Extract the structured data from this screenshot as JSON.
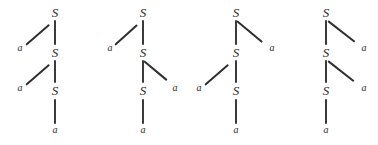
{
  "figure": {
    "kind": "derivation-trees",
    "node_labels": {
      "nonterminal": "S",
      "terminal": "a"
    },
    "colors": {
      "ink": "#2b2b2b",
      "edge": "#3a3a3a",
      "background": "#ffffff"
    },
    "trees": [
      {
        "id": "tree-1",
        "branch_sides": [
          "left",
          "left"
        ],
        "nodes": [
          {
            "label": "S",
            "type": "nonterminal",
            "level": 0
          },
          {
            "label": "a",
            "type": "terminal",
            "level": 1,
            "side": "left"
          },
          {
            "label": "S",
            "type": "nonterminal",
            "level": 1
          },
          {
            "label": "a",
            "type": "terminal",
            "level": 2,
            "side": "left"
          },
          {
            "label": "S",
            "type": "nonterminal",
            "level": 2
          },
          {
            "label": "a",
            "type": "terminal",
            "level": 3
          }
        ]
      },
      {
        "id": "tree-2",
        "branch_sides": [
          "left",
          "right"
        ],
        "nodes": [
          {
            "label": "S",
            "type": "nonterminal",
            "level": 0
          },
          {
            "label": "a",
            "type": "terminal",
            "level": 1,
            "side": "left"
          },
          {
            "label": "S",
            "type": "nonterminal",
            "level": 1
          },
          {
            "label": "a",
            "type": "terminal",
            "level": 2,
            "side": "right"
          },
          {
            "label": "S",
            "type": "nonterminal",
            "level": 2
          },
          {
            "label": "a",
            "type": "terminal",
            "level": 3
          }
        ]
      },
      {
        "id": "tree-3",
        "branch_sides": [
          "right",
          "left"
        ],
        "nodes": [
          {
            "label": "S",
            "type": "nonterminal",
            "level": 0
          },
          {
            "label": "a",
            "type": "terminal",
            "level": 1,
            "side": "right"
          },
          {
            "label": "S",
            "type": "nonterminal",
            "level": 1
          },
          {
            "label": "a",
            "type": "terminal",
            "level": 2,
            "side": "left"
          },
          {
            "label": "S",
            "type": "nonterminal",
            "level": 2
          },
          {
            "label": "a",
            "type": "terminal",
            "level": 3
          }
        ]
      },
      {
        "id": "tree-4",
        "branch_sides": [
          "right",
          "right"
        ],
        "nodes": [
          {
            "label": "S",
            "type": "nonterminal",
            "level": 0
          },
          {
            "label": "a",
            "type": "terminal",
            "level": 1,
            "side": "right"
          },
          {
            "label": "S",
            "type": "nonterminal",
            "level": 1
          },
          {
            "label": "a",
            "type": "terminal",
            "level": 2,
            "side": "right"
          },
          {
            "label": "S",
            "type": "nonterminal",
            "level": 2
          },
          {
            "label": "a",
            "type": "terminal",
            "level": 3
          }
        ]
      }
    ]
  }
}
